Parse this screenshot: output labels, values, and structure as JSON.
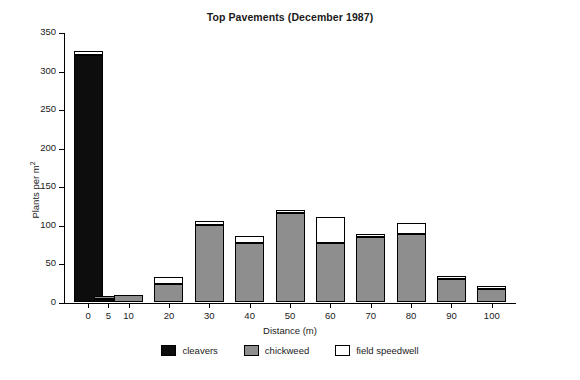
{
  "page_header_sliver": "1987 and March 1988",
  "chart_data": {
    "type": "bar",
    "subtype": "stacked",
    "title": "Top Pavements (December 1987)",
    "xlabel": "Distance (m)",
    "ylabel": "Plants per m²",
    "ylabel_base": "Plants per m",
    "ylabel_exponent": "2",
    "categories": [
      "0",
      "5",
      "10",
      "20",
      "30",
      "40",
      "50",
      "60",
      "70",
      "80",
      "90",
      "100"
    ],
    "xticks": [
      0,
      5,
      10,
      20,
      30,
      40,
      50,
      60,
      70,
      80,
      90,
      100
    ],
    "yticks": [
      0,
      50,
      100,
      150,
      200,
      250,
      300,
      350
    ],
    "ylim": [
      0,
      350
    ],
    "grid": false,
    "legend_position": "bottom-center",
    "series": [
      {
        "name": "cleavers",
        "color": "#0d0d0d",
        "values": [
          320,
          4,
          0,
          0,
          0,
          0,
          0,
          0,
          0,
          0,
          0,
          0
        ]
      },
      {
        "name": "chickweed",
        "color": "#8e8e8e",
        "values": [
          0,
          4,
          9,
          23,
          100,
          77,
          115,
          77,
          84,
          88,
          30,
          17
        ]
      },
      {
        "name": "field speedwell",
        "color": "#ffffff",
        "values": [
          5,
          0,
          0,
          10,
          5,
          8,
          3,
          33,
          3,
          15,
          2,
          2
        ]
      }
    ],
    "totals": [
      325,
      8,
      9,
      33,
      105,
      85,
      118,
      110,
      87,
      103,
      32,
      19
    ]
  },
  "legend": {
    "items": [
      {
        "label": "cleavers"
      },
      {
        "label": "chickweed"
      },
      {
        "label": "field speedwell"
      }
    ]
  }
}
